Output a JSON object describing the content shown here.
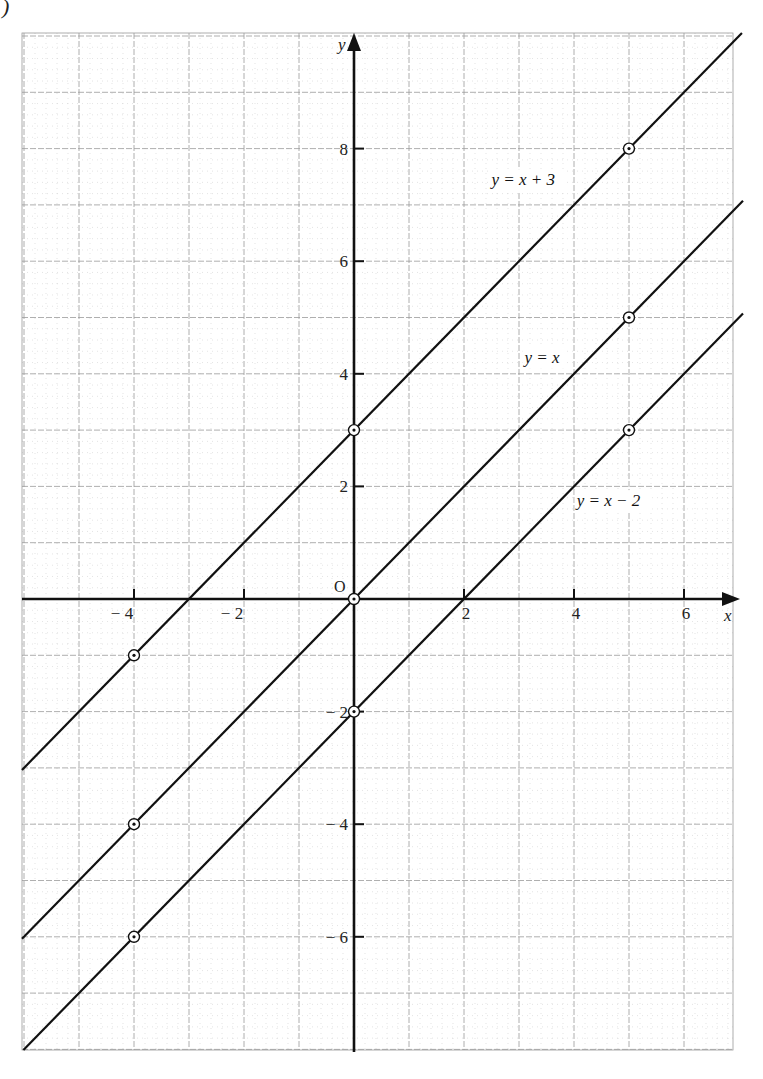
{
  "figure": {
    "corner_mark": ")"
  },
  "chart_data": {
    "type": "line",
    "title": "",
    "xlabel": "x",
    "ylabel": "y",
    "origin_label": "O",
    "xlim": [
      -6,
      7
    ],
    "ylim": [
      -8,
      10
    ],
    "grid": true,
    "x_ticks": [
      {
        "value": -4,
        "label": "− 4"
      },
      {
        "value": -2,
        "label": "− 2"
      },
      {
        "value": 2,
        "label": "2"
      },
      {
        "value": 4,
        "label": "4"
      },
      {
        "value": 6,
        "label": "6"
      }
    ],
    "y_ticks": [
      {
        "value": 8,
        "label": "8"
      },
      {
        "value": 6,
        "label": "6"
      },
      {
        "value": 4,
        "label": "4"
      },
      {
        "value": 2,
        "label": "2"
      },
      {
        "value": -2,
        "label": "− 2"
      },
      {
        "value": -4,
        "label": "− 4"
      },
      {
        "value": -6,
        "label": "− 6"
      }
    ],
    "series": [
      {
        "name": "y = x + 3",
        "slope": 1,
        "intercept": 3,
        "points": [
          {
            "x": -4,
            "y": -1
          },
          {
            "x": 0,
            "y": 3
          },
          {
            "x": 5,
            "y": 8
          }
        ],
        "label_pos": {
          "x": 2.5,
          "y": 7.35
        }
      },
      {
        "name": "y = x",
        "slope": 1,
        "intercept": 0,
        "points": [
          {
            "x": -4,
            "y": -4
          },
          {
            "x": 0,
            "y": 0
          },
          {
            "x": 5,
            "y": 5
          }
        ],
        "label_pos": {
          "x": 3.1,
          "y": 4.2
        }
      },
      {
        "name": "y = x − 2",
        "slope": 1,
        "intercept": -2,
        "points": [
          {
            "x": -4,
            "y": -6
          },
          {
            "x": 0,
            "y": -2
          },
          {
            "x": 5,
            "y": 3
          }
        ],
        "label_pos": {
          "x": 4.05,
          "y": 1.65
        }
      }
    ],
    "colors": {
      "line": "#111111",
      "axis": "#111111",
      "grid_major": "#9a9a9a",
      "grid_minor": "#d2d2d2"
    }
  }
}
